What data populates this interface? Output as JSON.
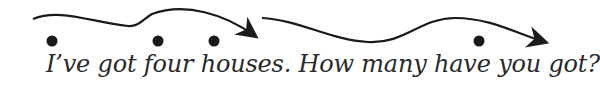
{
  "diagram": {
    "type": "intonation-contour",
    "caption": "I’ve got four houses. How many have you got?",
    "contours": [
      {
        "name": "statement-contour",
        "ending": "falling",
        "stressed_syllables": 3
      },
      {
        "name": "question-contour",
        "ending": "falling",
        "stressed_syllables": 1
      }
    ],
    "colors": {
      "ink": "#1a1a1a",
      "text": "#2a2a2a",
      "background": "#ffffff"
    }
  }
}
